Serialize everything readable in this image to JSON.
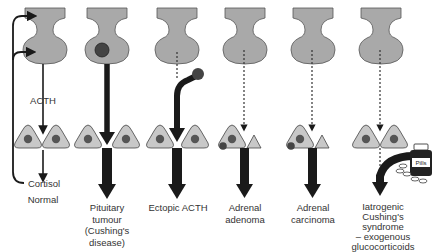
{
  "diagram": {
    "colors": {
      "gland_fill": "#a9a9a9",
      "cell_fill": "#c8c8c8",
      "nucleus_fill": "#555555",
      "arrow": "#1a1a1a",
      "text": "#333333"
    },
    "normal": {
      "hormone_label": "ACTH",
      "feedback_label": "Cortisol",
      "caption": "Normal"
    },
    "columns": [
      {
        "id": "normal",
        "caption": "Normal"
      },
      {
        "id": "pituitary-tumour",
        "caption": "Pituitary\ntumour\n(Cushing's\ndisease)"
      },
      {
        "id": "ectopic-acth",
        "caption": "Ectopic ACTH"
      },
      {
        "id": "adrenal-adenoma",
        "caption": "Adrenal\nadenoma"
      },
      {
        "id": "adrenal-carcinoma",
        "caption": "Adrenal\ncarcinoma"
      },
      {
        "id": "iatrogenic",
        "caption": "Iatrogenic\nCushing's\nsyndrome\n– exogenous\nglucocorticoids"
      }
    ],
    "pill_bottle_label": "Pills"
  }
}
